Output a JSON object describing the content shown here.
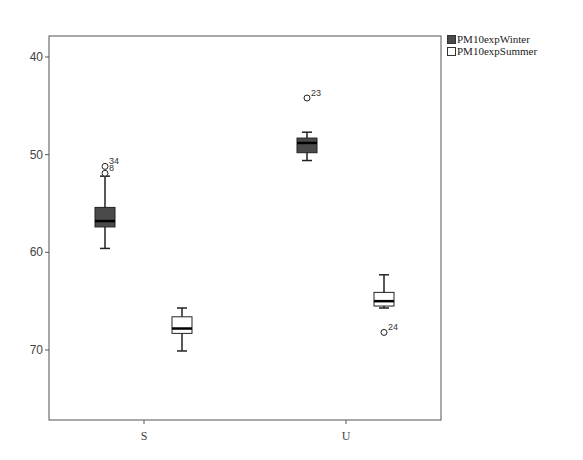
{
  "chart_data": {
    "type": "boxplot",
    "title": "",
    "xlabel": "",
    "ylabel": "",
    "categories": [
      "S",
      "U"
    ],
    "ylim": [
      33,
      73
    ],
    "yticks": [
      40,
      50,
      60,
      70
    ],
    "grid": false,
    "legend_position": "right-top",
    "series": [
      {
        "name": "PM10expWinter",
        "fill": "#4a4a4a",
        "boxes": [
          {
            "category": "S",
            "whisker_low": 50.4,
            "q1": 52.6,
            "median": 53.2,
            "q3": 54.6,
            "whisker_high": 57.8,
            "outliers": [
              {
                "value": 58.8,
                "label": "34"
              },
              {
                "value": 58.1,
                "label": "8"
              }
            ]
          },
          {
            "category": "U",
            "whisker_low": 59.4,
            "q1": 60.2,
            "median": 61.2,
            "q3": 61.7,
            "whisker_high": 62.3,
            "outliers": [
              {
                "value": 65.8,
                "label": "23"
              }
            ]
          }
        ]
      },
      {
        "name": "PM10expSummer",
        "fill": "#ffffff",
        "boxes": [
          {
            "category": "S",
            "whisker_low": 39.9,
            "q1": 41.7,
            "median": 42.2,
            "q3": 43.4,
            "whisker_high": 44.3,
            "outliers": []
          },
          {
            "category": "U",
            "whisker_low": 44.3,
            "q1": 44.5,
            "median": 45.0,
            "q3": 45.9,
            "whisker_high": 47.7,
            "outliers": [
              {
                "value": 41.8,
                "label": "24"
              }
            ]
          }
        ]
      }
    ]
  },
  "legend": {
    "items": [
      {
        "label": "PM10expWinter"
      },
      {
        "label": "PM10expSummer"
      }
    ]
  },
  "axis": {
    "y_tick_labels": [
      "70",
      "60",
      "50",
      "40"
    ],
    "x_tick_labels": [
      "S",
      "U"
    ]
  }
}
